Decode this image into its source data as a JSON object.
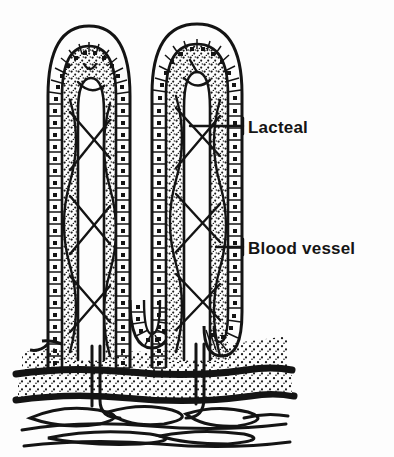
{
  "figure": {
    "background_color": "#fdfdfd",
    "ink_color": "#141414",
    "width": 394,
    "height": 457
  },
  "labels": [
    {
      "id": "lacteal",
      "text": "Lacteal",
      "text_x": 248,
      "text_y": 133,
      "leader_from_x": 190,
      "leader_from_y": 126,
      "leader_to_x": 243,
      "leader_to_y": 126,
      "tick_top_y": 118,
      "tick_bottom_y": 134
    },
    {
      "id": "blood-vessel",
      "text": "Blood vessel",
      "text_x": 248,
      "text_y": 254,
      "leader_from_x": 216,
      "leader_from_y": 247,
      "leader_to_x": 243,
      "leader_to_y": 247,
      "tick_top_y": 239,
      "tick_bottom_y": 255
    }
  ],
  "structures": {
    "villus_left": {
      "name": "villus",
      "left": 48,
      "right": 130,
      "top": 26,
      "base": 370
    },
    "villus_right": {
      "name": "villus",
      "left": 152,
      "right": 242,
      "top": 24,
      "base": 370
    },
    "epithelium": {
      "name": "columnar-epithelium",
      "cell_count_per_side": 34
    },
    "lamina_propria": {
      "name": "lamina-propria",
      "fill": "stipple"
    },
    "muscularis_mucosae": {
      "name": "muscularis-mucosae",
      "band_count": 2,
      "y_top": 372,
      "y_bottom": 398
    },
    "submucosa": {
      "name": "submucosa",
      "y_top": 400,
      "y_bottom": 450,
      "vessel_loops": 6
    }
  }
}
